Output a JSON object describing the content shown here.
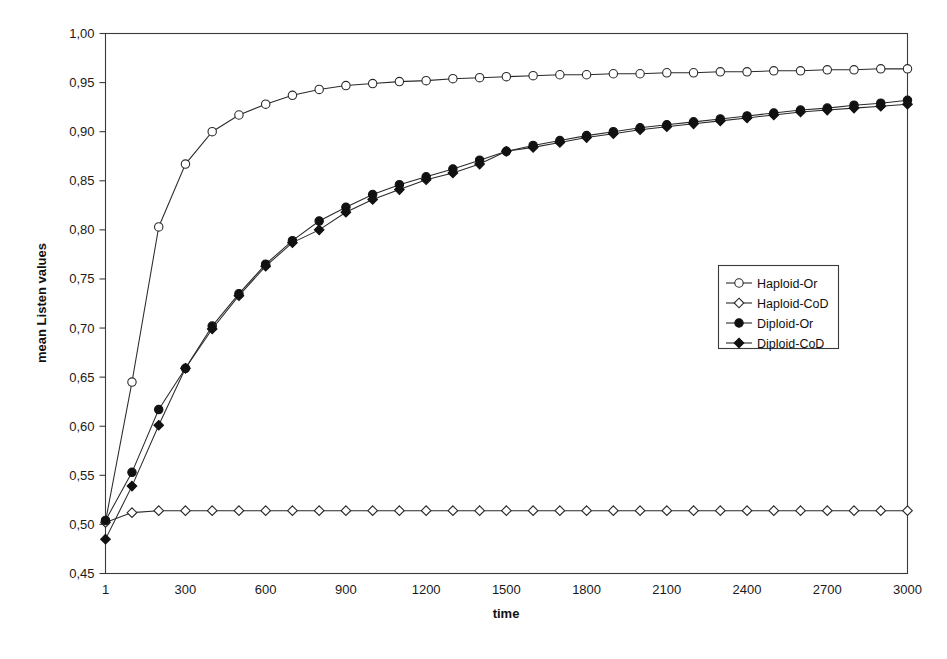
{
  "chart_data": {
    "type": "line",
    "title": "",
    "xlabel": "time",
    "ylabel": "mean Listen values",
    "xlim": [
      1,
      3000
    ],
    "ylim": [
      0.45,
      1.0
    ],
    "grid": false,
    "decimal_separator": ",",
    "legend_position": "right-middle",
    "y_ticks": [
      0.45,
      0.5,
      0.55,
      0.6,
      0.65,
      0.7,
      0.75,
      0.8,
      0.85,
      0.9,
      0.95,
      1.0
    ],
    "y_tick_labels": [
      "0,45",
      "0,50",
      "0,55",
      "0,60",
      "0,65",
      "0,70",
      "0,75",
      "0,80",
      "0,85",
      "0,90",
      "0,95",
      "1,00"
    ],
    "x_ticks": [
      1,
      300,
      600,
      900,
      1200,
      1500,
      1800,
      2100,
      2400,
      2700,
      3000
    ],
    "x_tick_labels": [
      "1",
      "300",
      "600",
      "900",
      "1200",
      "1500",
      "1800",
      "2100",
      "2400",
      "2700",
      "3000"
    ],
    "x": [
      1,
      100,
      200,
      300,
      400,
      500,
      600,
      700,
      800,
      900,
      1000,
      1100,
      1200,
      1300,
      1400,
      1500,
      1600,
      1700,
      1800,
      1900,
      2000,
      2100,
      2200,
      2300,
      2400,
      2500,
      2600,
      2700,
      2800,
      2900,
      3000
    ],
    "series": [
      {
        "name": "Haploid-Or",
        "marker": "open-circle",
        "values": [
          0.503,
          0.645,
          0.803,
          0.867,
          0.9,
          0.917,
          0.928,
          0.937,
          0.943,
          0.947,
          0.949,
          0.951,
          0.952,
          0.954,
          0.955,
          0.956,
          0.957,
          0.958,
          0.958,
          0.959,
          0.959,
          0.96,
          0.96,
          0.961,
          0.961,
          0.962,
          0.962,
          0.963,
          0.963,
          0.964,
          0.964
        ]
      },
      {
        "name": "Haploid-CoD",
        "marker": "open-diamond",
        "values": [
          0.502,
          0.512,
          0.514,
          0.514,
          0.514,
          0.514,
          0.514,
          0.514,
          0.514,
          0.514,
          0.514,
          0.514,
          0.514,
          0.514,
          0.514,
          0.514,
          0.514,
          0.514,
          0.514,
          0.514,
          0.514,
          0.514,
          0.514,
          0.514,
          0.514,
          0.514,
          0.514,
          0.514,
          0.514,
          0.514,
          0.514
        ]
      },
      {
        "name": "Diploid-Or",
        "marker": "filled-circle",
        "values": [
          0.504,
          0.553,
          0.617,
          0.659,
          0.702,
          0.735,
          0.765,
          0.789,
          0.809,
          0.823,
          0.836,
          0.846,
          0.854,
          0.862,
          0.871,
          0.88,
          0.886,
          0.891,
          0.896,
          0.9,
          0.904,
          0.907,
          0.91,
          0.913,
          0.916,
          0.919,
          0.922,
          0.924,
          0.927,
          0.929,
          0.932
        ]
      },
      {
        "name": "Diploid-CoD",
        "marker": "filled-diamond",
        "values": [
          0.485,
          0.539,
          0.601,
          0.659,
          0.699,
          0.733,
          0.763,
          0.787,
          0.8,
          0.818,
          0.831,
          0.841,
          0.851,
          0.858,
          0.867,
          0.88,
          0.884,
          0.889,
          0.894,
          0.898,
          0.902,
          0.905,
          0.908,
          0.911,
          0.914,
          0.917,
          0.92,
          0.922,
          0.924,
          0.926,
          0.928
        ]
      }
    ]
  },
  "legend": {
    "entries": [
      {
        "label": "Haploid-Or"
      },
      {
        "label": "Haploid-CoD"
      },
      {
        "label": "Diploid-Or"
      },
      {
        "label": "Diploid-CoD"
      }
    ]
  },
  "axes": {
    "x_title": "time",
    "y_title": "mean Listen values"
  }
}
